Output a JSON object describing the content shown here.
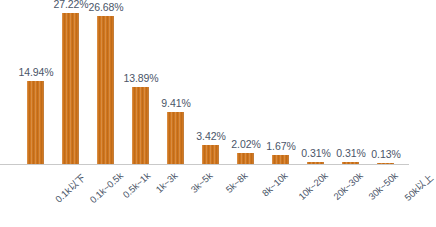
{
  "chart_data": {
    "type": "bar",
    "title": "",
    "subtitle": "",
    "xlabel": "",
    "ylabel": "",
    "ylim": [
      0,
      30
    ],
    "grid": false,
    "legend": "none",
    "value_suffix": "%",
    "categories": [
      "0.1k以下",
      "0.1k~0.5k",
      "0.5k~1k",
      "1k~3k",
      "3k~5k",
      "5k~8k",
      "8k~10k",
      "10k~20k",
      "20k~30k",
      "30k~50k",
      "50k以上"
    ],
    "values": [
      14.94,
      27.22,
      26.68,
      13.89,
      9.41,
      3.42,
      2.02,
      1.67,
      0.31,
      0.31,
      0.13
    ],
    "data_labels": [
      "14.94%",
      "27.22%",
      "26.68%",
      "13.89%",
      "9.41%",
      "3.42%",
      "2.02%",
      "1.67%",
      "0.31%",
      "0.31%",
      "0.13%"
    ]
  },
  "style": {
    "bar_color": "#d1761d",
    "label_color": "#4a5568",
    "axis_color": "#c9c9c9",
    "background": "#ffffff"
  }
}
